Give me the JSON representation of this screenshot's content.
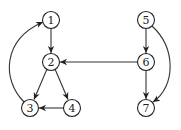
{
  "diagram": {
    "type": "directed-graph",
    "nodes": [
      {
        "id": "1",
        "label": "1",
        "x": 51,
        "y": 20
      },
      {
        "id": "2",
        "label": "2",
        "x": 51,
        "y": 62
      },
      {
        "id": "3",
        "label": "3",
        "x": 30,
        "y": 108
      },
      {
        "id": "4",
        "label": "4",
        "x": 72,
        "y": 108
      },
      {
        "id": "5",
        "label": "5",
        "x": 146,
        "y": 20
      },
      {
        "id": "6",
        "label": "6",
        "x": 146,
        "y": 62
      },
      {
        "id": "7",
        "label": "7",
        "x": 146,
        "y": 108
      }
    ],
    "edges": [
      {
        "from": "1",
        "to": "2"
      },
      {
        "from": "2",
        "to": "3"
      },
      {
        "from": "2",
        "to": "4"
      },
      {
        "from": "4",
        "to": "3"
      },
      {
        "from": "3",
        "to": "1",
        "curved": true
      },
      {
        "from": "6",
        "to": "2"
      },
      {
        "from": "5",
        "to": "6"
      },
      {
        "from": "6",
        "to": "7"
      },
      {
        "from": "5",
        "to": "7",
        "curved": true
      }
    ]
  }
}
